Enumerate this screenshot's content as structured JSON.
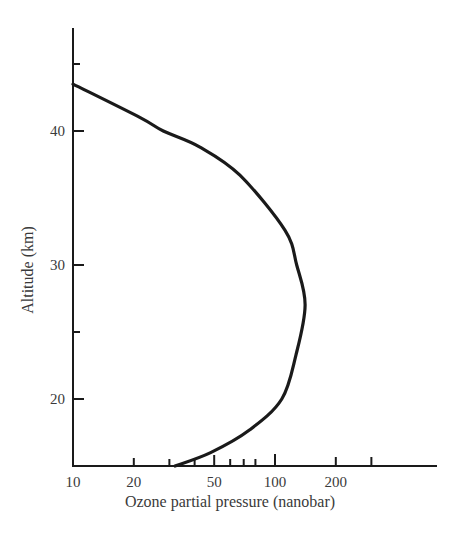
{
  "chart_data": {
    "type": "line",
    "title": "",
    "xlabel": "Ozone partial pressure (nanobar)",
    "ylabel": "Altitude (km)",
    "x_scale": "log",
    "xlim": [
      10,
      450
    ],
    "ylim": [
      15,
      48
    ],
    "x_ticks": {
      "labeled": [
        {
          "value": 10,
          "label": "10"
        },
        {
          "value": 20,
          "label": "20"
        },
        {
          "value": 50,
          "label": "50"
        },
        {
          "value": 100,
          "label": "100"
        },
        {
          "value": 200,
          "label": "200"
        }
      ],
      "minor": [
        30,
        40,
        60,
        70,
        80,
        300
      ]
    },
    "y_ticks": {
      "labeled": [
        {
          "value": 20,
          "label": "20"
        },
        {
          "value": 30,
          "label": "30"
        },
        {
          "value": 40,
          "label": "40"
        }
      ],
      "minor": [
        25,
        45
      ]
    },
    "grid": false,
    "legend": null,
    "series": [
      {
        "name": "Ozone profile",
        "color": "#1a1a1a",
        "points": [
          {
            "x": 10,
            "y": 43.5
          },
          {
            "x": 21.5,
            "y": 41.0
          },
          {
            "x": 28,
            "y": 40.0
          },
          {
            "x": 42.5,
            "y": 38.8
          },
          {
            "x": 67,
            "y": 36.7
          },
          {
            "x": 112,
            "y": 32.6
          },
          {
            "x": 128,
            "y": 30.0
          },
          {
            "x": 141,
            "y": 27.0
          },
          {
            "x": 127,
            "y": 23.3
          },
          {
            "x": 108,
            "y": 20.0
          },
          {
            "x": 75,
            "y": 17.7
          },
          {
            "x": 48,
            "y": 16.0
          },
          {
            "x": 32,
            "y": 15.0
          }
        ]
      }
    ]
  },
  "colors": {
    "ink": "#1a1a1a",
    "text": "#3a3a3a",
    "background": "#ffffff"
  }
}
